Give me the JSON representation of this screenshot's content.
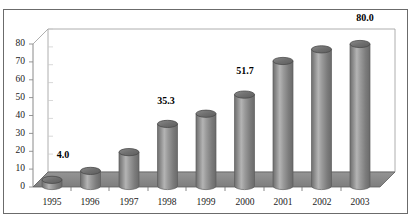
{
  "chart_data": {
    "type": "bar",
    "title": "",
    "subtitle": "",
    "xlabel": "",
    "ylabel": "",
    "categories": [
      "1995",
      "1996",
      "1997",
      "1998",
      "1999",
      "2000",
      "2001",
      "2002",
      "2003"
    ],
    "values": [
      4.0,
      9.0,
      19.5,
      35.3,
      41.0,
      51.7,
      70.5,
      77.0,
      80.0
    ],
    "point_labels": [
      "4.0",
      "",
      "",
      "35.3",
      "",
      "51.7",
      "",
      "",
      "80.0"
    ],
    "labelled_points": [
      {
        "category": "1995",
        "value": 4.0,
        "label": "4.0"
      },
      {
        "category": "1998",
        "value": 35.3,
        "label": "35.3"
      },
      {
        "category": "2000",
        "value": 51.7,
        "label": "51.7"
      },
      {
        "category": "2003",
        "value": 80.0,
        "label": "80.0"
      }
    ],
    "ylim": [
      0,
      80
    ],
    "yticks": [
      0,
      10,
      20,
      30,
      40,
      50,
      60,
      70,
      80
    ],
    "ytick_labels": [
      "0",
      "10",
      "20",
      "30",
      "40",
      "50",
      "60",
      "70",
      "80"
    ],
    "grid": false,
    "legend": false,
    "legend_position": "none",
    "style": "3d-cylinder",
    "colors": {
      "bar_face": "#8c8c8c",
      "bar_highlight": "#b8b8b8",
      "bar_shadow": "#6a6a6a",
      "bar_top": "#747474",
      "bar_top_edge": "#4a4a4a",
      "floor": "#8a8a8a",
      "floor_edge": "#5a5a5a",
      "wall": "#ffffff",
      "axis_line": "#808080",
      "frame": "#6b6b6b",
      "text": "#1a1a1a"
    }
  }
}
